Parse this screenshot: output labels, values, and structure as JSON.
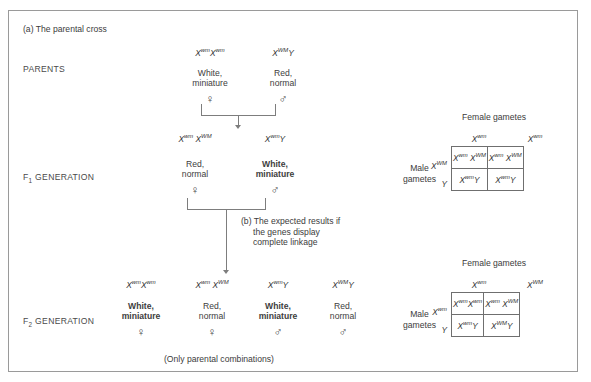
{
  "figure": {
    "panel_a_title": "(a) The parental cross",
    "panel_b_caption_line1": "(b) The expected results if",
    "panel_b_caption_line2": "the genes display",
    "panel_b_caption_line3": "complete linkage",
    "footnote": "(Only parental combinations)"
  },
  "generation_labels": {
    "parents": "PARENTS",
    "f1_prefix": "F",
    "f1_sub": "1",
    "f1_suffix": " GENERATION",
    "f2_prefix": "F",
    "f2_sub": "2",
    "f2_suffix": " GENERATION"
  },
  "symbols": {
    "female": "♀",
    "male": "♂"
  },
  "parents": [
    {
      "genotype_html": "X<sup>wm</sup>X<sup>wm</sup>",
      "phenotype_line1": "White,",
      "phenotype_line2": "miniature",
      "sex": "♀"
    },
    {
      "genotype_html": "X<sup>WM</sup>Y",
      "phenotype_line1": "Red,",
      "phenotype_line2": "normal",
      "sex": "♂"
    }
  ],
  "f1": [
    {
      "genotype_html": "X<sup>wm</sup> X<sup>WM</sup>",
      "phenotype_line1": "Red,",
      "phenotype_line2": "normal",
      "sex": "♀"
    },
    {
      "genotype_html": "X<sup>wm</sup>Y",
      "phenotype_line1": "White,",
      "phenotype_line2": "miniature",
      "sex": "♂"
    }
  ],
  "f2": [
    {
      "genotype_html": "X<sup>wm</sup>X<sup>wm</sup>",
      "phenotype_line1": "White,",
      "phenotype_line2": "miniature",
      "sex": "♀"
    },
    {
      "genotype_html": "X<sup>wm</sup> X<sup>WM</sup>",
      "phenotype_line1": "Red,",
      "phenotype_line2": "normal",
      "sex": "♀"
    },
    {
      "genotype_html": "X<sup>wm</sup>Y",
      "phenotype_line1": "White,",
      "phenotype_line2": "miniature",
      "sex": "♂"
    },
    {
      "genotype_html": "X<sup>WM</sup>Y",
      "phenotype_line1": "Red,",
      "phenotype_line2": "normal",
      "sex": "♂"
    }
  ],
  "punnett_top": {
    "female_title": "Female gametes",
    "male_title_line1": "Male",
    "male_title_line2": "gametes",
    "col_headers_html": [
      "X<sup>wm</sup>",
      "X<sup>wm</sup>"
    ],
    "row_headers_html": [
      "X<sup>WM</sup>",
      "Y"
    ],
    "cells_html": [
      [
        "X<sup>wm</sup> X<sup>WM</sup>",
        "X<sup>wm</sup> X<sup>WM</sup>"
      ],
      [
        "X<sup>wm</sup>Y",
        "X<sup>wm</sup>Y"
      ]
    ]
  },
  "punnett_bottom": {
    "female_title": "Female gametes",
    "male_title_line1": "Male",
    "male_title_line2": "gametes",
    "col_headers_html": [
      "X<sup>wm</sup>",
      "X<sup>WM</sup>"
    ],
    "row_headers_html": [
      "X<sup>wm</sup>",
      "Y"
    ],
    "cells_html": [
      [
        "X<sup>wm</sup>X<sup>wm</sup>",
        "X<sup>wm</sup> X<sup>WM</sup>"
      ],
      [
        "X<sup>wm</sup>Y",
        "X<sup>WM</sup>Y"
      ]
    ]
  },
  "colors": {
    "line": "#7d7d7d",
    "border": "#9a9a9a",
    "text": "#3e3e3e"
  }
}
